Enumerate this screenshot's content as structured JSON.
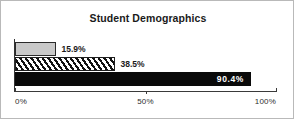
{
  "chart_data": {
    "type": "bar",
    "orientation": "horizontal",
    "title": "Student Demographics",
    "xlabel": "",
    "ylabel": "",
    "xlim": [
      0,
      100
    ],
    "grid": false,
    "legend": null,
    "categories": [
      "series-1",
      "series-2",
      "series-3"
    ],
    "values": [
      15.9,
      38.5,
      90.4
    ],
    "data_labels": [
      "15.9%",
      "38.5%",
      "90.4%"
    ],
    "bars": [
      {
        "value": 15.9,
        "label": "15.9%",
        "fill": "light-gray",
        "fill_color": "#c9c9c9",
        "edge_color": "#2b2b2b",
        "label_position": "outside",
        "label_color": "#1a1a1a"
      },
      {
        "value": 38.5,
        "label": "38.5%",
        "fill": "diagonal-hatch",
        "fill_color": "#ffffff",
        "edge_color": "#1f1f1f",
        "label_position": "outside",
        "label_color": "#1a1a1a"
      },
      {
        "value": 90.4,
        "label": "90.4%",
        "fill": "solid-black",
        "fill_color": "#0a0a0a",
        "edge_color": "#0a0a0a",
        "label_position": "inside",
        "label_color": "#ffffff"
      }
    ],
    "xticks": [
      0,
      50,
      100
    ],
    "xticklabels": [
      "0%",
      "50%",
      "100%"
    ]
  },
  "figure": {
    "border_color": "#b9b9b9",
    "background": "#ffffff",
    "axis_color": "#3a3a3a"
  }
}
